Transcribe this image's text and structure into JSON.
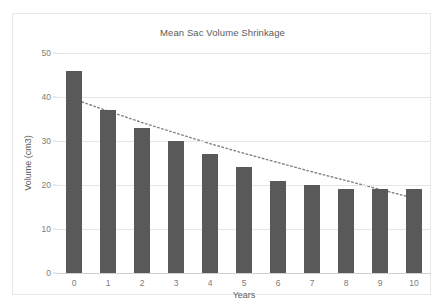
{
  "chart_data": {
    "type": "bar",
    "title": "Mean Sac Volume Shrinkage",
    "xlabel": "Years",
    "ylabel": "Volume (cm3)",
    "categories": [
      "0",
      "1",
      "2",
      "3",
      "4",
      "5",
      "6",
      "7",
      "8",
      "9",
      "10"
    ],
    "values": [
      46,
      37,
      33,
      30,
      27,
      24,
      21,
      20,
      19,
      19,
      19
    ],
    "ylim": [
      0,
      50
    ],
    "yticks": [
      "0",
      "10",
      "20",
      "30",
      "40",
      "50"
    ],
    "ytick_values": [
      0,
      10,
      20,
      30,
      40,
      50
    ],
    "grid": true,
    "legend": "none",
    "bar_color": "#595959",
    "gridline_color": "#e6e6e6",
    "series": [
      {
        "name": "Mean Sac Volume",
        "type": "bar",
        "values": [
          46,
          37,
          33,
          30,
          27,
          24,
          21,
          20,
          19,
          19,
          19
        ]
      },
      {
        "name": "Trendline",
        "type": "line",
        "style": "dotted",
        "color": "#808080",
        "values": [
          39.5,
          36.8,
          34.2,
          31.8,
          29.4,
          27.2,
          25.1,
          23.0,
          21.0,
          19.0,
          17.0
        ]
      }
    ],
    "annotations": []
  }
}
